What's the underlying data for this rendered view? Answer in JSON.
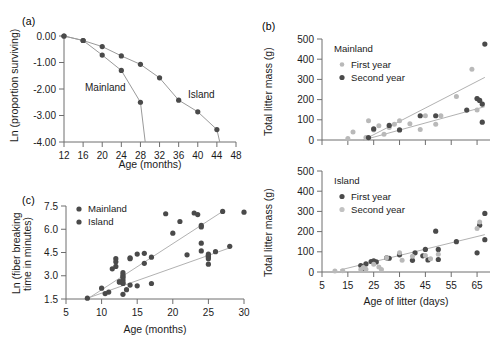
{
  "figure": {
    "panels": [
      "a",
      "b",
      "c"
    ],
    "colors": {
      "dark_marker": "#4a4a4a",
      "light_marker": "#b9b9b9",
      "line": "#a0a0a0",
      "axis": "#6e6e6e",
      "text": "#1b1b1b"
    }
  },
  "panel_a": {
    "tag": "(a)",
    "series_labels": {
      "mainland": "Mainland",
      "island": "Island"
    },
    "chart_data": {
      "type": "line",
      "title": "",
      "xlabel": "Age (months)",
      "ylabel": "Ln (proportion surviving)",
      "xlim": [
        12,
        48
      ],
      "ylim": [
        -4.0,
        0.0
      ],
      "xticks": [
        12,
        16,
        20,
        24,
        28,
        32,
        36,
        40,
        44,
        48
      ],
      "yticks": [
        0.0,
        -1.0,
        -2.0,
        -3.0,
        -4.0
      ],
      "ytick_labels": [
        "0.00",
        "-1.00",
        "-2.00",
        "-3.00",
        "-4.00"
      ],
      "grid": false,
      "legend": "inline-annotation",
      "series": [
        {
          "name": "Mainland",
          "marker": "dark",
          "x": [
            12,
            16,
            20,
            24,
            28,
            29
          ],
          "y": [
            0.0,
            -0.17,
            -0.72,
            -1.3,
            -2.5,
            -4.0
          ]
        },
        {
          "name": "Island",
          "marker": "dark",
          "x": [
            12,
            16,
            20,
            24,
            28,
            32,
            36,
            40,
            44,
            44.6
          ],
          "y": [
            0.0,
            -0.17,
            -0.4,
            -0.75,
            -1.07,
            -1.58,
            -2.42,
            -2.86,
            -3.53,
            -4.0
          ]
        }
      ]
    }
  },
  "panel_b_top": {
    "tag": "(b)",
    "legend": {
      "title": "Mainland",
      "items": [
        {
          "label": "First year",
          "marker": "light"
        },
        {
          "label": "Second year",
          "marker": "dark"
        }
      ]
    },
    "chart_data": {
      "type": "scatter",
      "title": "Mainland",
      "xlabel": "",
      "ylabel": "Total litter mass (g)",
      "xlim": [
        5,
        70
      ],
      "ylim": [
        0,
        500
      ],
      "xticks": [
        5,
        15,
        25,
        35,
        45,
        55,
        65
      ],
      "yticks": [
        0,
        100,
        200,
        300,
        400,
        500
      ],
      "grid": false,
      "legend_position": "upper-left",
      "series": [
        {
          "name": "First year",
          "marker": "light",
          "x": [
            15,
            17,
            22,
            23,
            25,
            27,
            29,
            31,
            33,
            35,
            39,
            43,
            45,
            49,
            51,
            57,
            63,
            65,
            65,
            66,
            67
          ],
          "y": [
            8,
            40,
            12,
            95,
            50,
            70,
            28,
            62,
            78,
            95,
            80,
            52,
            120,
            78,
            120,
            215,
            350,
            148,
            205,
            196,
            178
          ]
        },
        {
          "name": "Second year",
          "marker": "dark",
          "x": [
            23,
            25,
            31,
            35,
            43,
            49,
            61,
            65,
            66,
            67,
            67
          ],
          "y": [
            12,
            55,
            72,
            50,
            120,
            120,
            148,
            205,
            196,
            178,
            88
          ]
        },
        {
          "name": "Outlier high",
          "marker": "dark",
          "x": [
            68
          ],
          "y": [
            475
          ]
        }
      ],
      "fit_lines": [
        {
          "name": "upper",
          "x": [
            21,
            68
          ],
          "y": [
            0,
            310
          ]
        },
        {
          "name": "lower",
          "x": [
            21,
            68
          ],
          "y": [
            0,
            165
          ]
        }
      ]
    }
  },
  "panel_b_bottom": {
    "legend": {
      "title": "Island",
      "items": [
        {
          "label": "First year",
          "marker": "dark"
        },
        {
          "label": "Second year",
          "marker": "light"
        }
      ]
    },
    "chart_data": {
      "type": "scatter",
      "title": "Island",
      "xlabel": "Age of litter (days)",
      "ylabel": "Total litter mass (g)",
      "xlim": [
        5,
        70
      ],
      "ylim": [
        0,
        500
      ],
      "xticks": [
        5,
        15,
        25,
        35,
        45,
        55,
        65
      ],
      "yticks": [
        0,
        100,
        200,
        300,
        400,
        500
      ],
      "xtick_labels": [
        "5",
        "15",
        "25",
        "35",
        "45",
        "55",
        "65"
      ],
      "grid": false,
      "legend_position": "upper-left",
      "series": [
        {
          "name": "First year",
          "marker": "dark",
          "x": [
            20,
            21,
            22,
            24,
            25,
            26,
            30,
            31,
            35,
            40,
            41,
            44,
            45,
            46,
            49,
            50,
            50,
            57,
            65,
            66,
            68,
            68
          ],
          "y": [
            32,
            18,
            40,
            52,
            55,
            50,
            70,
            68,
            85,
            58,
            95,
            80,
            112,
            60,
            202,
            112,
            62,
            150,
            95,
            232,
            290,
            160
          ]
        },
        {
          "name": "Second year",
          "marker": "light",
          "x": [
            10,
            13,
            20,
            21,
            22,
            25,
            27,
            28,
            30,
            35,
            36,
            40,
            45,
            47,
            50,
            65,
            66
          ],
          "y": [
            5,
            6,
            12,
            22,
            14,
            38,
            25,
            12,
            70,
            95,
            58,
            78,
            82,
            66,
            88,
            215,
            248
          ]
        }
      ],
      "fit_lines": [
        {
          "name": "regression",
          "x": [
            12,
            68
          ],
          "y": [
            10,
            185
          ]
        }
      ]
    }
  },
  "panel_c": {
    "tag": "(c)",
    "legend": {
      "items": [
        {
          "label": "Mainland",
          "marker": "dark"
        },
        {
          "label": "Island",
          "marker": "dark"
        }
      ]
    },
    "chart_data": {
      "type": "scatter",
      "title": "",
      "xlabel": "Age (months)",
      "ylabel": "Ln (fiber breaking time in minutes)",
      "xlim": [
        5,
        30
      ],
      "ylim": [
        1.5,
        7.5
      ],
      "xticks": [
        5,
        10,
        15,
        20,
        25,
        30
      ],
      "yticks": [
        1.5,
        3.0,
        4.5,
        6.0,
        7.5
      ],
      "ytick_labels": [
        "1.5",
        "3.0",
        "4.5",
        "6.0",
        "7.5"
      ],
      "grid": false,
      "legend_position": "upper-left",
      "series": [
        {
          "name": "Mainland",
          "marker": "dark",
          "x": [
            8,
            10,
            10.5,
            11,
            11.5,
            12,
            12,
            12.5,
            13,
            13,
            13,
            13,
            13,
            13.5,
            14,
            14,
            14,
            15,
            16,
            16,
            17,
            19,
            20,
            21,
            23,
            23.5,
            24,
            24,
            24,
            25,
            27,
            30
          ],
          "y": [
            1.55,
            2.2,
            1.85,
            1.95,
            3.45,
            4.1,
            3.6,
            2.6,
            3.2,
            2.95,
            2.7,
            2.5,
            1.8,
            2.1,
            4.15,
            4.1,
            2.4,
            2.35,
            4.45,
            3.8,
            2.5,
            7.0,
            5.75,
            6.5,
            7.05,
            6.95,
            6.25,
            6.15,
            5.1,
            4.3,
            7.15,
            7.1
          ]
        },
        {
          "name": "Island",
          "marker": "dark",
          "x": [
            12,
            12.5,
            13,
            13,
            13,
            15,
            17,
            22,
            24,
            25,
            25,
            25,
            25,
            25,
            26,
            28
          ],
          "y": [
            3.9,
            2.6,
            3.05,
            2.85,
            2.55,
            4.4,
            4.2,
            4.35,
            4.6,
            4.4,
            4.3,
            4.2,
            4.1,
            3.75,
            4.55,
            4.9
          ]
        }
      ],
      "fit_lines": [
        {
          "name": "mainland-fit",
          "x": [
            8,
            27
          ],
          "y": [
            1.5,
            7.15
          ]
        },
        {
          "name": "island-fit",
          "x": [
            8,
            28
          ],
          "y": [
            1.55,
            4.8
          ]
        }
      ]
    }
  }
}
